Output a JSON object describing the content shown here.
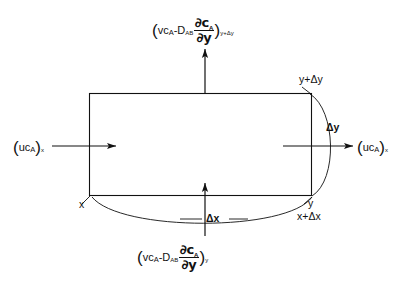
{
  "diagram": {
    "type": "control-volume-shell-balance",
    "background_color": "#ffffff",
    "line_color": "#111111",
    "rect": {
      "x": 89,
      "y": 93,
      "width": 223,
      "height": 103
    },
    "labels": {
      "top_flux": {
        "open_paren": "(",
        "convective": "vc",
        "convective_sub": "A",
        "minus": "-",
        "diffusivity": "D",
        "diffusivity_sub": "AB",
        "numerator_partial": "∂c",
        "numerator_sub": "A",
        "denominator_partial": "∂y",
        "close_paren": ")",
        "evaluated_at": "y+Δy"
      },
      "bottom_flux": {
        "open_paren": "(",
        "convective": "vc",
        "convective_sub": "A",
        "minus": "-",
        "diffusivity": "D",
        "diffusivity_sub": "AB",
        "numerator_partial": "∂c",
        "numerator_sub": "A",
        "denominator_partial": "∂y",
        "close_paren": ")",
        "evaluated_at": "y"
      },
      "left_flux": {
        "open_paren": "(",
        "convective": "uc",
        "convective_sub": "A",
        "close_paren": ")",
        "evaluated_at": "x"
      },
      "right_flux": {
        "open_paren": "(",
        "convective": "uc",
        "convective_sub": "A",
        "close_paren": ")",
        "evaluated_at": "x"
      },
      "corner_top_right": "y+Δy",
      "corner_bottom_right_upper": "y",
      "corner_bottom_right_lower": "x+Δx",
      "corner_bottom_left": "x",
      "dimension_delta_y": "Δy",
      "dimension_delta_x": "Δx"
    }
  }
}
